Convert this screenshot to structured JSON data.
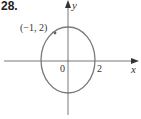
{
  "problem_number": "28.",
  "axes": {
    "x_label": "x",
    "y_label": "y"
  },
  "labels": {
    "origin": "0",
    "x_intercept": "2",
    "point": "(−1, 2)"
  },
  "curve": {
    "type": "ellipse",
    "center": [
      0,
      0
    ],
    "semi_axis_x": 2,
    "color": "#7a7a7a"
  },
  "marked_point": {
    "x": -1,
    "y": 2
  },
  "colors": {
    "axis": "#555555",
    "curve": "#7a7a7a",
    "text": "#333333"
  }
}
